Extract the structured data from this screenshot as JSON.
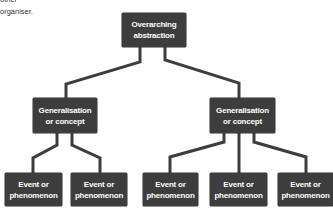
{
  "intro_text": {
    "line1": "other",
    "line2": "organiser."
  },
  "colors": {
    "node_fill": "#3d3d3d",
    "node_text": "#ffffff",
    "connector": "#3d3d3d",
    "background": "#ffffff"
  },
  "diagram": {
    "root": {
      "line1": "Overarching",
      "line2": "abstraction"
    },
    "generalisations": [
      {
        "line1": "Generalisation",
        "line2": "or concept"
      },
      {
        "line1": "Generalisation",
        "line2": "or concept"
      }
    ],
    "events": [
      {
        "line1": "Event or",
        "line2": "phenomenon"
      },
      {
        "line1": "Event or",
        "line2": "phenomenon"
      },
      {
        "line1": "Event or",
        "line2": "phenomenon"
      },
      {
        "line1": "Event or",
        "line2": "phenomenon"
      },
      {
        "line1": "Event or",
        "line2": "phenomenon"
      }
    ]
  }
}
